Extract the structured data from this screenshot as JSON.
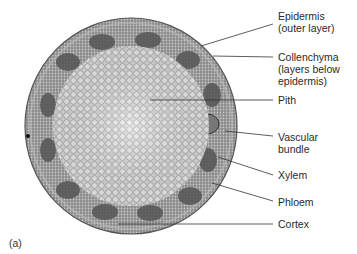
{
  "figure": {
    "panel_label": "(a)",
    "labels": [
      {
        "id": "epidermis",
        "lines": [
          "Epidermis",
          "(outer layer)"
        ],
        "x": 278,
        "y": 16
      },
      {
        "id": "collenchyma",
        "lines": [
          "Collenchyma",
          "(layers below",
          "epidermis)"
        ],
        "x": 278,
        "y": 51
      },
      {
        "id": "pith",
        "lines": [
          "Pith"
        ],
        "x": 278,
        "y": 96
      },
      {
        "id": "vascular-bundle",
        "lines": [
          "Vascular",
          "bundle"
        ],
        "x": 278,
        "y": 131
      },
      {
        "id": "xylem",
        "lines": [
          "Xylem"
        ],
        "x": 278,
        "y": 170
      },
      {
        "id": "phloem",
        "lines": [
          "Phloem"
        ],
        "x": 278,
        "y": 197
      },
      {
        "id": "cortex",
        "lines": [
          "Cortex"
        ],
        "x": 278,
        "y": 220
      }
    ]
  }
}
